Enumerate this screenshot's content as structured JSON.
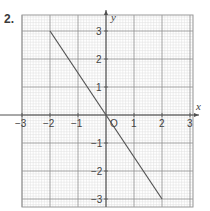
{
  "problem": {
    "number": "2."
  },
  "chart_data": {
    "type": "line",
    "title": "",
    "xlabel": "x",
    "ylabel": "y",
    "xlim": [
      -3,
      3
    ],
    "ylim": [
      -3,
      3
    ],
    "grid": true,
    "x_ticks": [
      "-3",
      "-2",
      "-1",
      "0",
      "1",
      "2",
      "3"
    ],
    "y_ticks": [
      "3",
      "2",
      "1",
      "-1",
      "-2",
      "-3"
    ],
    "origin_label": "O",
    "series": [
      {
        "name": "line",
        "x": [
          -2,
          2
        ],
        "y": [
          3,
          -3
        ],
        "equation": "y = -1.5x"
      }
    ]
  },
  "labels": {
    "x_axis": "x",
    "y_axis": "y",
    "origin": "O",
    "xt": {
      "m3": "−3",
      "m2": "−2",
      "m1": "−1",
      "p1": "1",
      "p2": "2",
      "p3": "3"
    },
    "yt": {
      "p3": "3",
      "p2": "2",
      "p1": "1",
      "m1": "−1",
      "m2": "−2",
      "m3": "−3"
    }
  },
  "colors": {
    "minor_grid": "#dcdcdc",
    "major_grid": "#8c8c8c",
    "axis": "#505050",
    "line": "#505050"
  }
}
